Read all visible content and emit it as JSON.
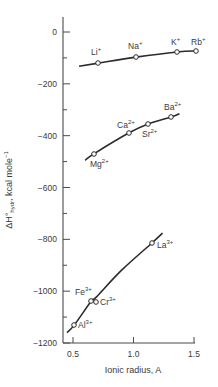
{
  "chart_data": {
    "type": "line",
    "title": "",
    "xlabel": "Ionic radius, A",
    "ylabel": "ΔH°hydr, kcal mole⁻¹",
    "xlim": [
      0.4,
      1.5
    ],
    "ylim": [
      -1200,
      50
    ],
    "x_ticks": [
      0.5,
      1.0,
      1.5
    ],
    "x_tick_labels": [
      "0.5",
      "1.0",
      "1.5"
    ],
    "y_ticks": [
      0,
      -200,
      -400,
      -600,
      -800,
      -1000,
      -1200
    ],
    "y_tick_labels": [
      "0",
      "−200",
      "−400",
      "−600",
      "−800",
      "−1000",
      "−1200"
    ],
    "grid": false,
    "legend": null,
    "series": [
      {
        "name": "Monovalent ions (M+)",
        "curve": [
          [
            0.55,
            -132
          ],
          [
            0.71,
            -120
          ],
          [
            1.02,
            -97
          ],
          [
            1.36,
            -77
          ],
          [
            1.52,
            -73
          ]
        ],
        "points": [
          {
            "label": "Li",
            "charge": "+",
            "x": 0.68,
            "y": -120
          },
          {
            "label": "Na",
            "charge": "+",
            "x": 0.97,
            "y": -97
          },
          {
            "label": "K",
            "charge": "+",
            "x": 1.33,
            "y": -77
          },
          {
            "label": "Rb",
            "charge": "+",
            "x": 1.48,
            "y": -73
          }
        ]
      },
      {
        "name": "Divalent ions (M2+)",
        "curve": [
          [
            0.6,
            -495
          ],
          [
            0.67,
            -471
          ],
          [
            0.96,
            -390
          ],
          [
            1.12,
            -355
          ],
          [
            1.31,
            -328
          ],
          [
            1.38,
            -315
          ]
        ],
        "points": [
          {
            "label": "Mg",
            "charge": "2+",
            "x": 0.66,
            "y": -471
          },
          {
            "label": "Ca",
            "charge": "2+",
            "x": 0.99,
            "y": -390
          },
          {
            "label": "Sr",
            "charge": "2+",
            "x": 1.12,
            "y": -355
          },
          {
            "label": "Ba",
            "charge": "2+",
            "x": 1.34,
            "y": -328
          }
        ]
      },
      {
        "name": "Trivalent ions (M3+)",
        "curve": [
          [
            0.45,
            -1160
          ],
          [
            0.51,
            -1131
          ],
          [
            0.65,
            -1039
          ],
          [
            0.69,
            -1024
          ],
          [
            0.9,
            -920
          ],
          [
            1.15,
            -815
          ],
          [
            1.24,
            -776
          ]
        ],
        "points": [
          {
            "label": "Al",
            "charge": "3+",
            "x": 0.51,
            "y": -1131
          },
          {
            "label": "Fe",
            "charge": "3+",
            "x": 0.64,
            "y": -1039
          },
          {
            "label": "Cr",
            "charge": "3+",
            "x": 0.69,
            "y": -1042
          },
          {
            "label": "La",
            "charge": "3+",
            "x": 1.15,
            "y": -815
          }
        ]
      }
    ]
  },
  "labels": {
    "xlabel": "Ionic radius, A",
    "ylabel_main": "ΔH°",
    "ylabel_sub": "hydr",
    "ylabel_rest": ", kcal mole",
    "ylabel_sup": "−1",
    "ions": {
      "li": {
        "sym": "Li",
        "sup": "+"
      },
      "na": {
        "sym": "Na",
        "sup": "+"
      },
      "k": {
        "sym": "K",
        "sup": "+"
      },
      "rb": {
        "sym": "Rb",
        "sup": "+"
      },
      "mg": {
        "sym": "Mg",
        "sup": "2+"
      },
      "ca": {
        "sym": "Ca",
        "sup": "2+"
      },
      "sr": {
        "sym": "Sr",
        "sup": "2+"
      },
      "ba": {
        "sym": "Ba",
        "sup": "2+"
      },
      "al": {
        "sym": "Al",
        "sup": "3+"
      },
      "fe": {
        "sym": "Fe",
        "sup": "3+"
      },
      "cr": {
        "sym": "Cr",
        "sup": "3+"
      },
      "la": {
        "sym": "La",
        "sup": "3+"
      }
    }
  },
  "colors": {
    "line": "#2b2b2b",
    "axis": "#4a4a4a",
    "text": "#3a3a3a",
    "marker_fill": "#ffffff"
  }
}
